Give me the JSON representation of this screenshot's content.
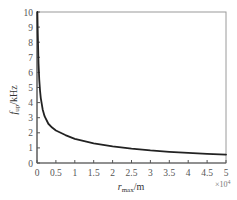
{
  "chart_data": {
    "type": "line",
    "title": "",
    "xlabel": "r_max/m",
    "xlabel_main": "r",
    "xlabel_sub": "max",
    "xlabel_unit": "/m",
    "ylabel": "f_up/kHz",
    "ylabel_main": "f",
    "ylabel_sub": "up",
    "ylabel_unit": "/kHz",
    "x_multiplier": "×10⁴",
    "x_multiplier_base": "×10",
    "x_multiplier_exp": "4",
    "xlim": [
      0,
      5
    ],
    "ylim": [
      0,
      10
    ],
    "xticks": [
      "0",
      "0.5",
      "1",
      "1.5",
      "2",
      "2.5",
      "3",
      "3.5",
      "4",
      "4.5",
      "5"
    ],
    "yticks": [
      "0",
      "1",
      "2",
      "3",
      "4",
      "5",
      "6",
      "7",
      "8",
      "9",
      "10"
    ],
    "grid": false,
    "legend": null,
    "series": [
      {
        "name": "f_up",
        "color": "#222222",
        "x": [
          0.01,
          0.02,
          0.04,
          0.06,
          0.08,
          0.1,
          0.15,
          0.2,
          0.3,
          0.4,
          0.5,
          0.75,
          1.0,
          1.5,
          2.0,
          2.5,
          3.0,
          3.5,
          4.0,
          4.5,
          5.0
        ],
        "y": [
          10.0,
          8.6,
          6.6,
          5.5,
          4.8,
          4.3,
          3.55,
          3.1,
          2.6,
          2.35,
          2.15,
          1.85,
          1.6,
          1.3,
          1.1,
          0.95,
          0.83,
          0.74,
          0.67,
          0.61,
          0.56
        ]
      }
    ]
  }
}
